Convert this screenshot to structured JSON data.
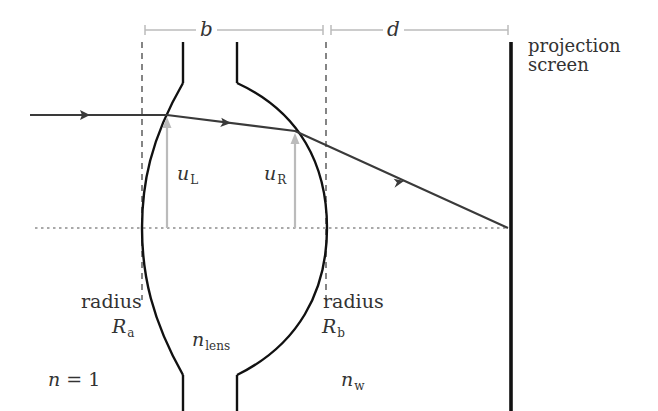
{
  "diagram": {
    "dimensions": {
      "b": {
        "label": "b",
        "from_x": 145,
        "to_x": 323,
        "y": 30
      },
      "d": {
        "label": "d",
        "from_x": 331,
        "to_x": 508,
        "y": 30
      }
    },
    "labels": {
      "projection_screen_line1": "projection",
      "projection_screen_line2": "screen",
      "u_left_main": "u",
      "u_left_sub": "L",
      "u_right_main": "u",
      "u_right_sub": "R",
      "radius_a_word": "radius",
      "radius_a_main": "R",
      "radius_a_sub": "a",
      "radius_b_word": "radius",
      "radius_b_main": "R",
      "radius_b_sub": "b",
      "n_lens_main": "n",
      "n_lens_sub": "lens",
      "n_air": "n = 1",
      "n_air_main": "n",
      "n_air_eq": " = 1",
      "n_w_main": "n",
      "n_w_sub": "w"
    },
    "colors": {
      "ink": "#111111",
      "ray": "#3a3a3a",
      "gray_marker": "#bbbbbb",
      "text": "#333333",
      "background": "#ffffff"
    },
    "geometry": {
      "optical_axis_y": 228,
      "screen_x": 511,
      "ray_points": [
        [
          30,
          115
        ],
        [
          167,
          115
        ],
        [
          295,
          131
        ],
        [
          508,
          228
        ]
      ],
      "dashed_verticals_x": [
        142,
        326
      ],
      "lens_stub_left_x": 183,
      "lens_stub_right_x": 237
    }
  }
}
